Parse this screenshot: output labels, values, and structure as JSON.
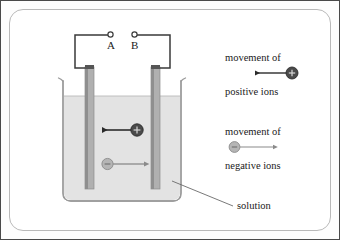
{
  "diagram": {
    "terminals": [
      {
        "id": "A",
        "label": "A"
      },
      {
        "id": "B",
        "label": "B"
      }
    ],
    "labels": {
      "solution": "solution",
      "movement_of_1": "movement of",
      "positive_ions": "positive ions",
      "movement_of_2": "movement of",
      "negative_ions": "negative ions"
    },
    "ions": {
      "positive": {
        "sign": "+",
        "direction": "left",
        "fill": "#4a4a4a"
      },
      "negative": {
        "sign": "−",
        "direction": "right",
        "fill": "#b5b5b5"
      }
    },
    "colors": {
      "solution_fill": "#e3e3e3",
      "beaker_stroke": "#9a9a9a",
      "electrode_fill": "#b0b0b0",
      "electrode_edge": "#7d7d7d",
      "wire": "#3a3a3a",
      "frame": "#b9b9b9",
      "text": "#1a1a1a"
    }
  }
}
